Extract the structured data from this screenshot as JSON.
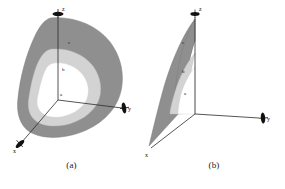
{
  "figure": {
    "type": "diagram",
    "background_color": "#ffffff"
  },
  "colors": {
    "outer_band": "#8f8f8f",
    "middle_band": "#d3d3d3",
    "inner_region": "#ffffff",
    "axis_line": "#2a2a2a",
    "arrow_head": "#111111",
    "text": "#1a1a1a",
    "outline": "#6e6e6e"
  },
  "panels": [
    {
      "id": "a",
      "caption": "(a)",
      "axes": [
        {
          "name": "z",
          "label": "z",
          "direction": "up"
        },
        {
          "name": "y",
          "label": "y",
          "direction": "right"
        },
        {
          "name": "x",
          "label": "x",
          "direction": "lower-left"
        }
      ],
      "zones": [
        {
          "label": "c",
          "band": "outer",
          "shade": "#8f8f8f"
        },
        {
          "label": "b",
          "band": "middle",
          "shade": "#d3d3d3"
        },
        {
          "label": "a",
          "band": "inner",
          "shade": "#ffffff"
        }
      ],
      "view": "three-dimensional nested isosurfaces"
    },
    {
      "id": "b",
      "caption": "(b)",
      "axes": [
        {
          "name": "z",
          "label": "z",
          "direction": "up"
        },
        {
          "name": "y",
          "label": "y",
          "direction": "right"
        },
        {
          "name": "x",
          "label": "x",
          "direction": "lower-left"
        }
      ],
      "zones": [
        {
          "label": "c",
          "band": "outer",
          "shade": "#8f8f8f"
        },
        {
          "label": "b",
          "band": "middle",
          "shade": "#d3d3d3"
        },
        {
          "label": "a",
          "band": "inner",
          "shade": "#ffffff"
        }
      ],
      "view": "x-z plane cross-section of the nested regions"
    }
  ]
}
